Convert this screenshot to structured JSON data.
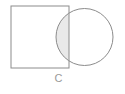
{
  "figure": {
    "caption": "C",
    "background_color": "#ffffff",
    "stroke_color": "#8c8c8c",
    "shading_color": "#e9e9e9",
    "caption_color": "#9a9a9a",
    "canvas": {
      "width": 125,
      "height": 94
    },
    "shapes": [
      {
        "name": "square",
        "type": "rect",
        "x": 11,
        "y": 6,
        "width": 58,
        "height": 62,
        "fill": "none",
        "stroke": "#8c8c8c",
        "stroke_width": 1
      },
      {
        "name": "circle",
        "type": "circle",
        "cx": 84.5,
        "cy": 37,
        "r": 28.5,
        "fill": "none",
        "stroke": "#8c8c8c",
        "stroke_width": 1
      }
    ],
    "intersection": {
      "name": "overlap-region",
      "fill": "#e9e9e9",
      "x_left": 56,
      "x_right": 69,
      "y_top": 8.5,
      "y_bottom": 65.5
    }
  }
}
